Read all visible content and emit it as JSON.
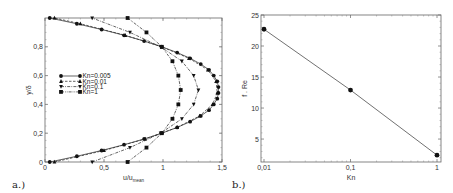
{
  "chart_data": [
    {
      "type": "line",
      "panel_label": "a.)",
      "title": "",
      "xlabel": "u/u",
      "xlabel_subscript": "mean",
      "ylabel": "y/δ",
      "xlim": [
        0,
        1.5
      ],
      "ylim": [
        0,
        1
      ],
      "xticks": [
        0,
        0.5,
        1,
        1.5
      ],
      "xtick_labels": [
        "0",
        "0,5",
        "1",
        "1,5"
      ],
      "yticks": [
        0,
        0.2,
        0.4,
        0.6,
        0.8
      ],
      "ytick_labels": [
        "0",
        "0,2",
        "0,4",
        "0,6",
        "0,8"
      ],
      "grid": false,
      "legend_position": "center-left",
      "series": [
        {
          "name": "Kn=0.005",
          "marker": "circle",
          "dash": "solid",
          "y": [
            0.0,
            0.04,
            0.08,
            0.12,
            0.16,
            0.2,
            0.24,
            0.28,
            0.32,
            0.36,
            0.4,
            0.44,
            0.48,
            0.52,
            0.56,
            0.6,
            0.64,
            0.68,
            0.72,
            0.76,
            0.8,
            0.84,
            0.88,
            0.92,
            0.96,
            1.0
          ],
          "x": [
            0.04,
            0.27,
            0.48,
            0.67,
            0.84,
            0.99,
            1.12,
            1.23,
            1.32,
            1.39,
            1.43,
            1.46,
            1.47,
            1.47,
            1.46,
            1.43,
            1.39,
            1.32,
            1.23,
            1.12,
            0.99,
            0.84,
            0.67,
            0.48,
            0.27,
            0.04
          ]
        },
        {
          "name": "Kn=0.01",
          "marker": "triangle-up",
          "dash": "dashed",
          "y": [
            0.0,
            0.08,
            0.16,
            0.24,
            0.32,
            0.4,
            0.48,
            0.56,
            0.64,
            0.72,
            0.8,
            0.88,
            0.96,
            1.0
          ],
          "x": [
            0.08,
            0.5,
            0.85,
            1.12,
            1.31,
            1.42,
            1.46,
            1.45,
            1.38,
            1.22,
            0.99,
            0.68,
            0.3,
            0.08
          ]
        },
        {
          "name": "Kn=0.1",
          "marker": "triangle-down",
          "dash": "dashdot",
          "y": [
            0.0,
            0.1,
            0.2,
            0.3,
            0.4,
            0.5,
            0.6,
            0.7,
            0.8,
            0.9,
            1.0
          ],
          "x": [
            0.4,
            0.72,
            0.98,
            1.16,
            1.26,
            1.3,
            1.26,
            1.16,
            0.98,
            0.72,
            0.4
          ]
        },
        {
          "name": "Kn=1",
          "marker": "square",
          "dash": "dashdotdot",
          "y": [
            0.0,
            0.1,
            0.2,
            0.3,
            0.4,
            0.5,
            0.6,
            0.7,
            0.8,
            0.9,
            1.0
          ],
          "x": [
            0.7,
            0.86,
            0.99,
            1.08,
            1.13,
            1.15,
            1.13,
            1.08,
            0.99,
            0.86,
            0.7
          ]
        }
      ]
    },
    {
      "type": "line",
      "panel_label": "b.)",
      "title": "",
      "xlabel": "Kn",
      "ylabel": "f . Re",
      "xscale": "log",
      "xlim": [
        0.01,
        1
      ],
      "ylim": [
        1.3,
        25
      ],
      "xticks": [
        0.01,
        0.1,
        1
      ],
      "xtick_labels": [
        "0,01",
        "0,1",
        "1"
      ],
      "yticks": [
        5,
        10,
        15,
        20,
        25
      ],
      "ytick_labels": [
        "5",
        "10",
        "15",
        "20",
        "25"
      ],
      "grid": false,
      "series": [
        {
          "name": "f.Re",
          "marker": "circle",
          "dash": "solid",
          "x": [
            0.01,
            0.1,
            1
          ],
          "y": [
            22.7,
            12.9,
            2.4
          ]
        }
      ]
    }
  ]
}
